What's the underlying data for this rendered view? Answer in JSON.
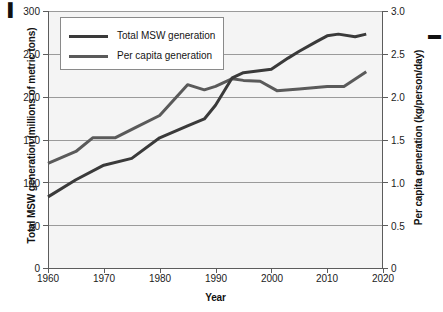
{
  "chart_data": {
    "type": "line",
    "title": "",
    "xlabel": "Year",
    "ylabel": "Total MSW generation (millions of metric tons)",
    "y2label": "Per capita generation (kg/person/day)",
    "xlim": [
      1960,
      2020
    ],
    "ylim": [
      0,
      300
    ],
    "y2lim": [
      0,
      3.0
    ],
    "grid": true,
    "legend_position": "top-left",
    "x_ticks": [
      "1960",
      "1970",
      "1980",
      "1990",
      "2000",
      "2010",
      "2020"
    ],
    "x_tick_values": [
      1960,
      1970,
      1980,
      1990,
      2000,
      2010,
      2020
    ],
    "y_ticks": [
      "0",
      "50",
      "100",
      "150",
      "200",
      "250",
      "300"
    ],
    "y_tick_values": [
      0,
      50,
      100,
      150,
      200,
      250,
      300
    ],
    "y2_ticks": [
      "0",
      "0.5",
      "1.0",
      "1.5",
      "2.0",
      "2.5",
      "3.0"
    ],
    "y2_tick_values": [
      0,
      0.5,
      1.0,
      1.5,
      2.0,
      2.5,
      3.0
    ],
    "series": [
      {
        "name": "Total MSW generation",
        "axis": "left",
        "color": "#3a3a3a",
        "x": [
          1960,
          1965,
          1970,
          1975,
          1980,
          1985,
          1988,
          1990,
          1993,
          1995,
          2000,
          2003,
          2005,
          2008,
          2010,
          2012,
          2015,
          2017
        ],
        "values": [
          83,
          103,
          120,
          128,
          152,
          166,
          174,
          190,
          222,
          228,
          232,
          245,
          253,
          264,
          271,
          273,
          270,
          273
        ]
      },
      {
        "name": "Per capita generation",
        "axis": "right",
        "color": "#5a5a5a",
        "x": [
          1960,
          1965,
          1968,
          1972,
          1976,
          1980,
          1985,
          1988,
          1990,
          1993,
          1995,
          1998,
          2001,
          2005,
          2010,
          2013,
          2017
        ],
        "values": [
          1.22,
          1.36,
          1.52,
          1.52,
          1.65,
          1.78,
          2.14,
          2.08,
          2.12,
          2.21,
          2.19,
          2.18,
          2.07,
          2.09,
          2.12,
          2.12,
          2.29
        ]
      }
    ]
  },
  "legend": {
    "items": [
      {
        "label": "Total MSW generation",
        "color": "#3a3a3a"
      },
      {
        "label": "Per capita generation",
        "color": "#5a5a5a"
      }
    ]
  },
  "axes": {
    "x_title": "Year",
    "y_left_title": "Total MSW generation (millions of metric tons)",
    "y_right_title": "Per capita generation (kg/person/day)"
  },
  "ticks": {
    "left": [
      "300",
      "250",
      "200",
      "150",
      "100",
      "50",
      "0"
    ],
    "right": [
      "3.0",
      "2.5",
      "2.0",
      "1.5",
      "1.0",
      "0.5",
      "0"
    ],
    "bottom": [
      "1960",
      "1970",
      "1980",
      "1990",
      "2000",
      "2010",
      "2020"
    ]
  },
  "style": {
    "plot_background": "#f4f4f4",
    "grid_color": "#9a9a9a",
    "axis_color": "#5c5c5c",
    "text_color": "#1b1b1b"
  }
}
